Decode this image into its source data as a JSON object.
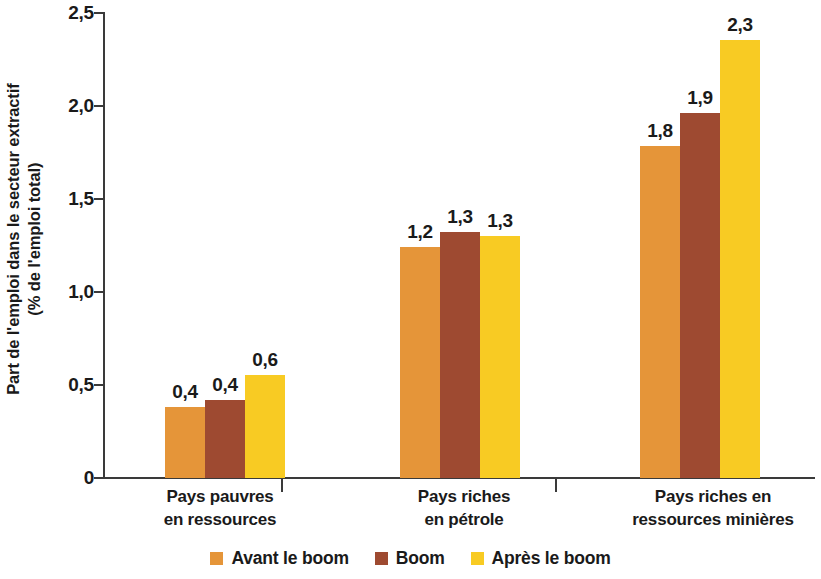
{
  "chart_data": {
    "type": "bar",
    "title": "",
    "subtitle": "",
    "xlabel": "",
    "ylabel": "Part de l'emploi dans le secteur extractif\n(% de l'emploi total)",
    "ylabel_lines": [
      "Part de l'emploi dans le secteur extractif",
      "(% de l'emploi total)"
    ],
    "categories": [
      "Pays pauvres en ressources",
      "Pays riches en pétrole",
      "Pays riches en ressources minières"
    ],
    "category_lines": [
      [
        "Pays pauvres",
        "en ressources"
      ],
      [
        "Pays riches",
        "en pétrole"
      ],
      [
        "Pays riches en",
        "ressources minières"
      ]
    ],
    "series": [
      {
        "name": "Avant le boom",
        "color": "#e59539",
        "values": [
          0.38,
          1.24,
          1.78
        ],
        "labels": [
          "0,4",
          "1,2",
          "1,8"
        ]
      },
      {
        "name": "Boom",
        "color": "#9e4a31",
        "values": [
          0.42,
          1.32,
          1.96
        ],
        "labels": [
          "0,4",
          "1,3",
          "1,9"
        ]
      },
      {
        "name": "Après le boom",
        "color": "#f8cb23",
        "values": [
          0.55,
          1.3,
          2.35
        ],
        "labels": [
          "0,6",
          "1,3",
          "2,3"
        ]
      }
    ],
    "ylim": [
      0,
      2.5
    ],
    "yticks": [
      0,
      0.5,
      1.0,
      1.5,
      2.0,
      2.5
    ],
    "ytick_labels": [
      "0",
      "0,5",
      "1,0",
      "1,5",
      "2,0",
      "2,5"
    ],
    "grid": false,
    "legend_position": "bottom"
  },
  "legend": {
    "items": [
      {
        "label": "Avant le boom",
        "color": "#e59539"
      },
      {
        "label": "Boom",
        "color": "#9e4a31"
      },
      {
        "label": "Après le boom",
        "color": "#f8cb23"
      }
    ]
  },
  "axis": {
    "line_color": "#3a3a3a"
  }
}
